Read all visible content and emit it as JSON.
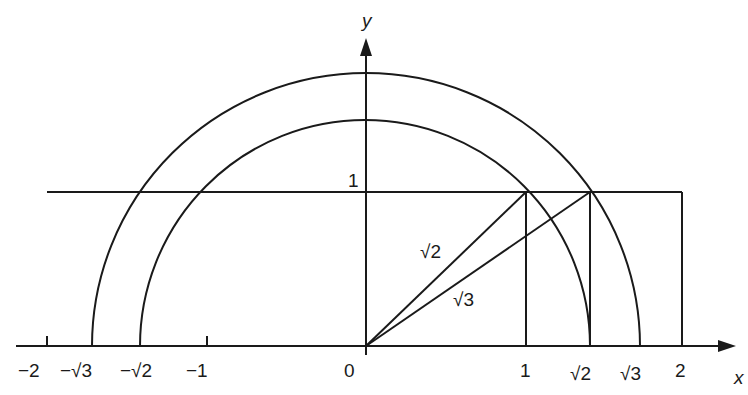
{
  "figure": {
    "axes": {
      "x_label": "x",
      "y_label": "y"
    },
    "x_tick_labels": {
      "neg2": "−2",
      "neg_sqrt3": "−√3",
      "neg_sqrt2": "−√2",
      "neg1": "−1",
      "zero": "0",
      "one": "1",
      "sqrt2": "√2",
      "sqrt3": "√3",
      "two": "2"
    },
    "y_tick_labels": {
      "one": "1"
    },
    "segment_labels": {
      "hyp1": "√2",
      "hyp2": "√3"
    }
  }
}
